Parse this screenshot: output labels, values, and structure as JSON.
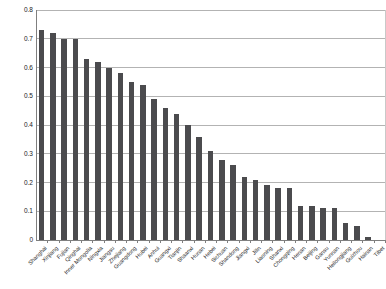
{
  "chart_data": {
    "type": "bar",
    "title": "",
    "xlabel": "",
    "ylabel": "",
    "ylim": [
      0,
      0.8
    ],
    "yticks": [
      "0",
      "0.1",
      "0.2",
      "0.3",
      "0.4",
      "0.5",
      "0.6",
      "0.7",
      "0.8"
    ],
    "grid": true,
    "legend": false,
    "bar_color": "#4b4b4e",
    "gridline_color": "#b3b3b3",
    "axis_color": "#7f7f7f",
    "categories": [
      "Shanghai",
      "Xinjiang",
      "Fujian",
      "Qinghai",
      "Inner Mongolia",
      "Ningxia",
      "Jiangsu",
      "Zhejiang",
      "Guangdong",
      "Hubei",
      "Anhui",
      "Guangxi",
      "Tianjin",
      "Shaanxi",
      "Hunan",
      "Hebei",
      "Sichuan",
      "Shandong",
      "Jiangxi",
      "Jilin",
      "Liaoning",
      "Shanxi",
      "Chongqing",
      "Henan",
      "Beijing",
      "Gansu",
      "Yunnan",
      "Heilongjiang",
      "Guizhou",
      "Hainan",
      "Tibet"
    ],
    "values": [
      0.73,
      0.72,
      0.7,
      0.7,
      0.63,
      0.62,
      0.6,
      0.58,
      0.55,
      0.54,
      0.49,
      0.46,
      0.44,
      0.4,
      0.36,
      0.31,
      0.28,
      0.26,
      0.22,
      0.21,
      0.19,
      0.18,
      0.18,
      0.12,
      0.12,
      0.11,
      0.11,
      0.06,
      0.05,
      0.01,
      0.0
    ]
  }
}
